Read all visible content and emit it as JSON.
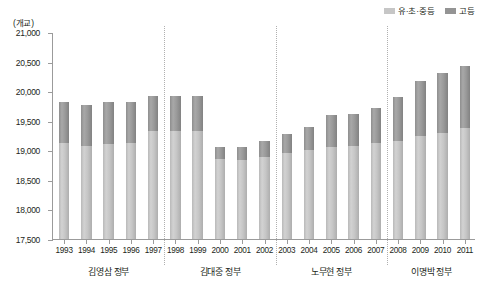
{
  "unit_label": "(개교)",
  "legend": [
    {
      "name": "series-legend-elementary",
      "label": "유·초·중등",
      "color": "#c6c6c6"
    },
    {
      "name": "series-legend-higher",
      "label": "고등",
      "color": "#949494"
    }
  ],
  "chart_data": {
    "type": "bar",
    "title": "",
    "subtitle": "",
    "xlabel": "",
    "ylabel": "(개교)",
    "ylim": [
      17500,
      21000
    ],
    "ytick_step": 500,
    "ytick_labels": [
      "21,000",
      "20,500",
      "20,000",
      "19,500",
      "19,000",
      "18,500",
      "18,000",
      "17,500"
    ],
    "ytick_values": [
      21000,
      20500,
      20000,
      19500,
      19000,
      18500,
      18000,
      17500
    ],
    "grid": false,
    "stacked": true,
    "legend_position": "top-right",
    "categories": [
      "1993",
      "1994",
      "1995",
      "1996",
      "1997",
      "1998",
      "1999",
      "2000",
      "2001",
      "2002",
      "2003",
      "2004",
      "2005",
      "2006",
      "2007",
      "2008",
      "2009",
      "2010",
      "2011"
    ],
    "series": [
      {
        "name": "유·초·중등",
        "color": "#c6c6c6",
        "values": [
          19120,
          19080,
          19110,
          19130,
          19320,
          19330,
          19330,
          18850,
          18830,
          18880,
          18950,
          19000,
          19050,
          19080,
          19120,
          19160,
          19240,
          19290,
          19370
        ]
      },
      {
        "name": "고등",
        "color": "#949494",
        "values": [
          700,
          690,
          700,
          680,
          600,
          590,
          590,
          200,
          230,
          270,
          330,
          390,
          550,
          530,
          590,
          740,
          930,
          1010,
          1060
        ]
      }
    ],
    "totals": [
      19820,
      19770,
      19810,
      19810,
      19920,
      19920,
      19920,
      19050,
      19060,
      19150,
      19280,
      19390,
      19600,
      19610,
      19710,
      19900,
      20170,
      20300,
      20430
    ],
    "group_labels": [
      "김영삼 정부",
      "김대중 정부",
      "노무현 정부",
      "이명박 정부"
    ],
    "groups": [
      {
        "label": "김영삼 정부",
        "years": [
          "1993",
          "1994",
          "1995",
          "1996",
          "1997"
        ]
      },
      {
        "label": "김대중 정부",
        "years": [
          "1998",
          "1999",
          "2000",
          "2001",
          "2002"
        ]
      },
      {
        "label": "노무현 정부",
        "years": [
          "2003",
          "2004",
          "2005",
          "2006",
          "2007"
        ]
      },
      {
        "label": "이명박 정부",
        "years": [
          "2008",
          "2009",
          "2010",
          "2011"
        ]
      }
    ]
  }
}
